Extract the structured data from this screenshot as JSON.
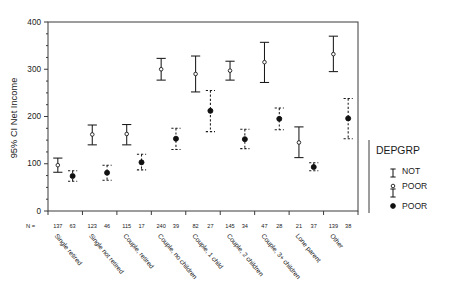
{
  "chart_data": {
    "type": "scatter",
    "title": "",
    "xlabel": "",
    "ylabel": "95% CI Net Income",
    "ylim": [
      0,
      400
    ],
    "yticks": [
      0,
      100,
      200,
      300,
      400
    ],
    "ytick_labels": [
      "0",
      "100",
      "200",
      "300",
      "400"
    ],
    "grid": false,
    "legend_position": "right",
    "legend_title": "DEPGRP",
    "n_row_prefix": "N =",
    "categories": [
      "Single retired",
      "Single not retired",
      "Couple, retired",
      "Couple, no children",
      "Couple, 1 child",
      "Couple, 2 children",
      "Couple, 3+ children",
      "Lone parent",
      "Other"
    ],
    "series": [
      {
        "name": "NOT POOR",
        "marker": "open-circle",
        "line_style": "solid",
        "n": [
          137,
          123,
          115,
          240,
          82,
          145,
          47,
          21,
          139
        ],
        "values": [
          97,
          162,
          163,
          300,
          290,
          297,
          315,
          145,
          332
        ],
        "ci_lower": [
          82,
          140,
          140,
          277,
          252,
          277,
          272,
          113,
          295
        ],
        "ci_upper": [
          112,
          182,
          183,
          323,
          328,
          317,
          357,
          178,
          370
        ]
      },
      {
        "name": "POOR",
        "marker": "filled-circle",
        "line_style": "dashed",
        "n": [
          63,
          46,
          17,
          39,
          27,
          34,
          28,
          37,
          38
        ],
        "values": [
          74,
          81,
          103,
          153,
          212,
          152,
          195,
          93,
          196
        ],
        "ci_lower": [
          63,
          65,
          87,
          130,
          168,
          132,
          172,
          85,
          153
        ],
        "ci_upper": [
          85,
          97,
          120,
          175,
          255,
          173,
          218,
          102,
          238
        ]
      }
    ]
  },
  "legend": {
    "title": "DEPGRP",
    "entries": [
      {
        "line_label": "NOT",
        "marker_label": "POOR",
        "marker": "open-circle"
      },
      {
        "line_label": "",
        "marker_label": "POOR",
        "marker": "filled-circle"
      }
    ]
  }
}
